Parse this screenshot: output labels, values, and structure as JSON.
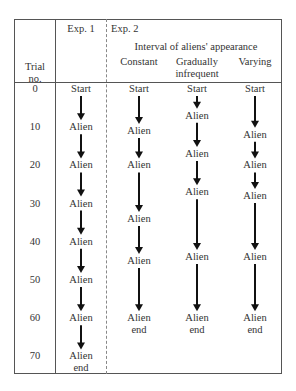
{
  "header": {
    "trial_col": "Trial\nno.",
    "trial_col_line1": "Trial",
    "trial_col_line2": "no.",
    "exp1": "Exp. 1",
    "exp2": "Exp. 2",
    "exp2_subtitle": "Interval of aliens' appearance",
    "conditions": [
      {
        "line1": "Constant",
        "line2": ""
      },
      {
        "line1": "Gradually",
        "line2": "infrequent"
      },
      {
        "line1": "Varying",
        "line2": ""
      }
    ]
  },
  "trial_numbers": [
    "0",
    "10",
    "20",
    "30",
    "40",
    "50",
    "60",
    "70"
  ],
  "columns": [
    {
      "id": "exp1",
      "events": [
        {
          "label": "Start",
          "trial": 0
        },
        {
          "label": "Alien",
          "trial": 10
        },
        {
          "label": "Alien",
          "trial": 20
        },
        {
          "label": "Alien",
          "trial": 30
        },
        {
          "label": "Alien",
          "trial": 40
        },
        {
          "label": "Alien",
          "trial": 50
        },
        {
          "label": "Alien",
          "trial": 60
        },
        {
          "label": "Alien",
          "label2": "end",
          "trial": 70
        }
      ]
    },
    {
      "id": "constant",
      "events": [
        {
          "label": "Start",
          "trial": 0
        },
        {
          "label": "Alien",
          "trial": 11
        },
        {
          "label": "Alien",
          "trial": 20
        },
        {
          "label": "Alien",
          "trial": 34
        },
        {
          "label": "Alien",
          "trial": 45
        },
        {
          "label": "Alien",
          "label2": "end",
          "trial": 60
        }
      ]
    },
    {
      "id": "gradually-infrequent",
      "events": [
        {
          "label": "Start",
          "trial": 0
        },
        {
          "label": "Alien",
          "trial": 7
        },
        {
          "label": "Alien",
          "trial": 17
        },
        {
          "label": "Alien",
          "trial": 27
        },
        {
          "label": "Alien",
          "trial": 44
        },
        {
          "label": "Alien",
          "label2": "end",
          "trial": 60
        }
      ]
    },
    {
      "id": "varying",
      "events": [
        {
          "label": "Start",
          "trial": 0
        },
        {
          "label": "Alien",
          "trial": 12
        },
        {
          "label": "Alien",
          "trial": 20
        },
        {
          "label": "Alien",
          "trial": 28
        },
        {
          "label": "Alien",
          "trial": 44
        },
        {
          "label": "Alien",
          "label2": "end",
          "trial": 60
        }
      ]
    }
  ],
  "colors": {
    "text": "#333333",
    "arrow": "#111111",
    "border": "#555555"
  }
}
